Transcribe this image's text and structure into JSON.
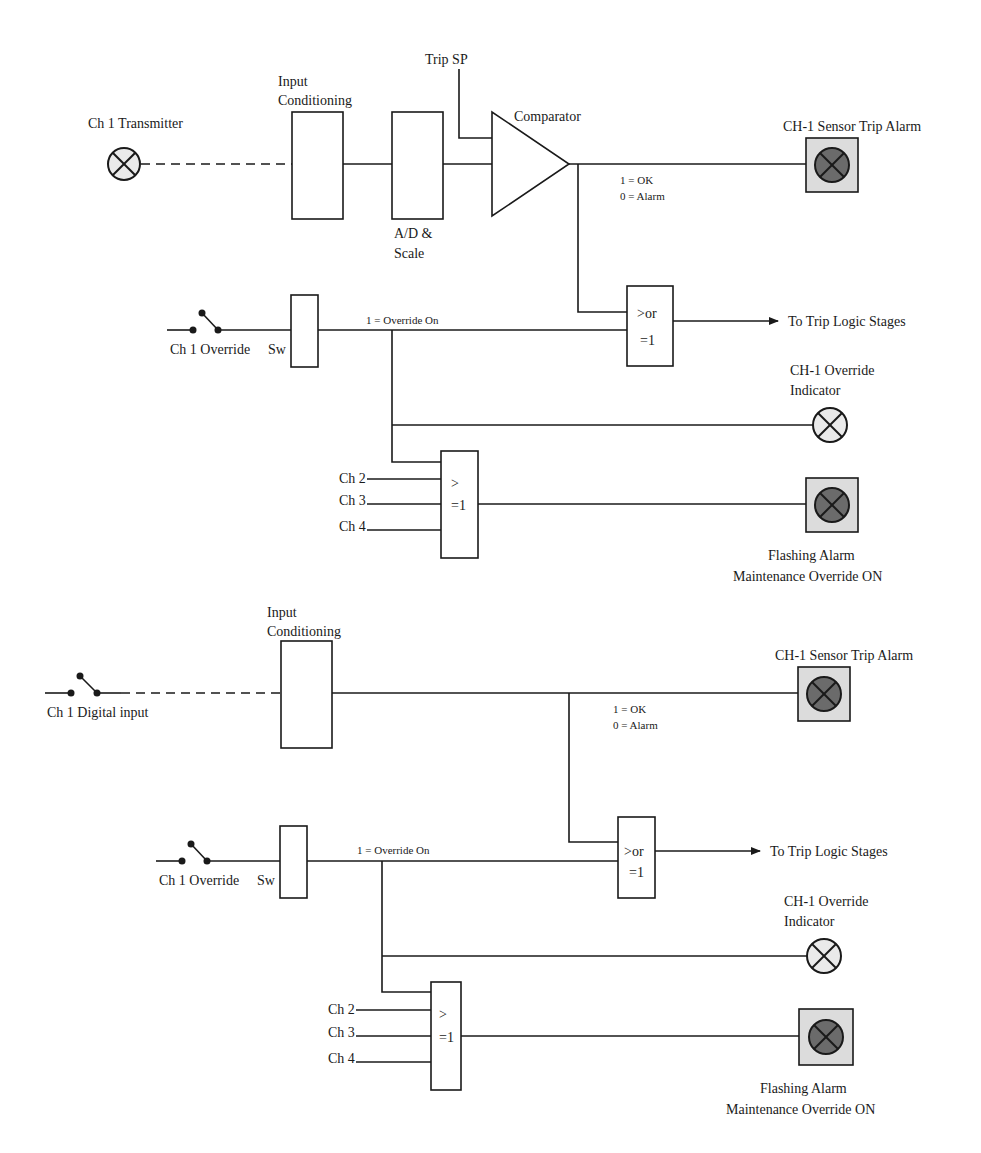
{
  "diagrams": [
    {
      "id": "analog",
      "input_label": "Ch 1 Transmitter",
      "input_conditioning": [
        "Input",
        "Conditioning"
      ],
      "ad_scale": [
        "A/D &",
        "Scale"
      ],
      "trip_sp": "Trip SP",
      "comparator": "Comparator",
      "sensor_alarm": "CH-1 Sensor Trip Alarm",
      "status_ok": "1 = OK",
      "status_alarm": "0 = Alarm",
      "override_switch": "Ch 1 Override",
      "sw": "Sw",
      "override_on": "1 = Override On",
      "or_gate": [
        ">or",
        "=1"
      ],
      "trip_output": "To Trip Logic Stages",
      "override_indicator": [
        "CH-1 Override",
        "Indicator"
      ],
      "channels": [
        "Ch 2",
        "Ch 3",
        "Ch 4"
      ],
      "ge_gate": [
        ">",
        "=1"
      ],
      "flashing_alarm": [
        "Flashing  Alarm",
        "Maintenance Override ON"
      ]
    },
    {
      "id": "digital",
      "input_label": "Ch 1 Digital input",
      "input_conditioning": [
        "Input",
        "Conditioning"
      ],
      "sensor_alarm": "CH-1 Sensor Trip Alarm",
      "status_ok": "1 = OK",
      "status_alarm": "0 = Alarm",
      "override_switch": "Ch 1 Override",
      "sw": "Sw",
      "override_on": "1 = Override On",
      "or_gate": [
        ">or",
        "=1"
      ],
      "trip_output": "To Trip Logic Stages",
      "override_indicator": [
        "CH-1 Override",
        "Indicator"
      ],
      "channels": [
        "Ch 2",
        "Ch 3",
        "Ch 4"
      ],
      "ge_gate": [
        ">",
        "=1"
      ],
      "flashing_alarm": [
        "Flashing  Alarm",
        "Maintenance Override ON"
      ]
    }
  ]
}
